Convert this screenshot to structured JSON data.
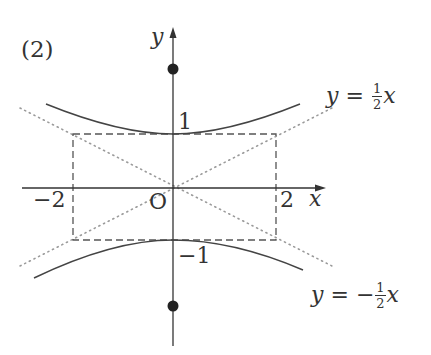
{
  "figure": {
    "panel_label": "(2)",
    "axes": {
      "x_label": "x",
      "y_label": "y",
      "origin_label": "O",
      "origin_px": [
        173,
        188
      ],
      "unit_px": {
        "x": 51.5,
        "y": 53
      }
    },
    "ticks": {
      "x_neg": "−2",
      "x_pos": "2",
      "y_pos": "1",
      "y_neg": "−1"
    },
    "curve": {
      "name": "hyperbola",
      "equation": "y^2 - x^2/4 = 1",
      "vertices": [
        [
          0,
          1
        ],
        [
          0,
          -1
        ]
      ],
      "foci": [
        [
          0,
          2.236
        ],
        [
          0,
          -2.236
        ]
      ],
      "x_range": [
        -2.47,
        2.47
      ]
    },
    "asymptotes": [
      {
        "label_lhs": "y",
        "label_eq": "=",
        "sign": "",
        "num": "1",
        "den": "2",
        "var": "x",
        "slope": 0.5
      },
      {
        "label_lhs": "y",
        "label_eq": "=",
        "sign": "−",
        "num": "1",
        "den": "2",
        "var": "x",
        "slope": -0.5
      }
    ],
    "reference_rectangle": {
      "x": [
        -2,
        2
      ],
      "y": [
        -1,
        1
      ],
      "style": "dashed"
    },
    "colors": {
      "ink": "#333333",
      "dotted": "#999999"
    }
  }
}
